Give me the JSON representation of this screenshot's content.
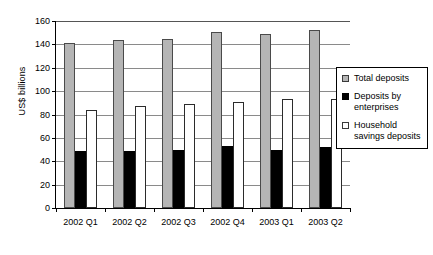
{
  "chart_data": {
    "type": "bar",
    "title": "",
    "subtitle": "",
    "xlabel": "",
    "ylabel": "US$ billions",
    "ylim": [
      0,
      160
    ],
    "yticks": [
      0,
      20,
      40,
      60,
      80,
      100,
      120,
      140,
      160
    ],
    "grid": true,
    "legend_position": "right",
    "categories": [
      "2002 Q1",
      "2002 Q2",
      "2002 Q3",
      "2002 Q4",
      "2003 Q1",
      "2003 Q2"
    ],
    "series": [
      {
        "name": "Total deposits",
        "color": "#b5b5b5",
        "values": [
          141,
          144,
          145,
          151,
          149,
          152
        ]
      },
      {
        "name": "Deposits by enterprises",
        "color": "#000000",
        "values": [
          49,
          49,
          50,
          53,
          50,
          52
        ]
      },
      {
        "name": "Household savings deposits",
        "color": "#ffffff",
        "values": [
          84,
          87,
          89,
          91,
          93,
          93
        ]
      }
    ]
  },
  "legend": {
    "items": [
      {
        "label": "Total deposits",
        "swatch": "total"
      },
      {
        "label": "Deposits by enterprises",
        "swatch": "enterprises"
      },
      {
        "label": "Household savings deposits",
        "swatch": "household"
      }
    ]
  }
}
